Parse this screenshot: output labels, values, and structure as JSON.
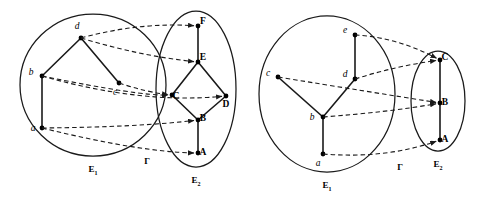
{
  "figure": {
    "background_color": "#ffffff",
    "stroke_color": "#1a1a1a",
    "node_color": "#000000",
    "title": "",
    "panels": [
      {
        "id": "panel-left",
        "source_set": {
          "label": "E",
          "subscript": "1",
          "nodes": [
            {
              "id": "a",
              "label": "a",
              "x": 42,
              "y": 128,
              "label_x": 33,
              "label_y": 131
            },
            {
              "id": "b",
              "label": "b",
              "x": 42,
              "y": 76,
              "label_x": 31,
              "label_y": 75
            },
            {
              "id": "c",
              "label": "c",
              "x": 119,
              "y": 83,
              "label_x": 115,
              "label_y": 95
            },
            {
              "id": "d",
              "label": "d",
              "x": 81,
              "y": 38,
              "label_x": 77,
              "label_y": 29
            }
          ],
          "edges": [
            {
              "from": "a",
              "to": "b"
            },
            {
              "from": "b",
              "to": "d"
            },
            {
              "from": "d",
              "to": "c"
            }
          ],
          "ellipse": {
            "cx": 93,
            "cy": 85,
            "rx": 73,
            "ry": 71
          }
        },
        "target_set": {
          "label": "E",
          "subscript": "2",
          "nodes": [
            {
              "id": "A",
              "label": "A",
              "x": 198,
              "y": 153,
              "label_x": 203,
              "label_y": 155
            },
            {
              "id": "B",
              "label": "B",
              "x": 198,
              "y": 120,
              "label_x": 203,
              "label_y": 121
            },
            {
              "id": "C",
              "label": "C",
              "x": 172,
              "y": 95,
              "label_x": 176,
              "label_y": 99
            },
            {
              "id": "D",
              "label": "D",
              "x": 226,
              "y": 96,
              "label_x": 226,
              "label_y": 107
            },
            {
              "id": "E",
              "label": "E",
              "x": 198,
              "y": 62,
              "label_x": 203,
              "label_y": 60
            },
            {
              "id": "F",
              "label": "F",
              "x": 198,
              "y": 26,
              "label_x": 203,
              "label_y": 24
            }
          ],
          "edges": [
            {
              "from": "A",
              "to": "B"
            },
            {
              "from": "B",
              "to": "C"
            },
            {
              "from": "B",
              "to": "D"
            },
            {
              "from": "C",
              "to": "E"
            },
            {
              "from": "D",
              "to": "E"
            },
            {
              "from": "E",
              "to": "F"
            }
          ],
          "ellipse": {
            "cx": 196,
            "cy": 89,
            "rx": 40,
            "ry": 78
          }
        },
        "map_label": "Γ",
        "map_label_x": 147,
        "map_label_y": 164,
        "mappings": [
          {
            "from": "d",
            "to": "F",
            "cx": 140,
            "cy": 22
          },
          {
            "from": "d",
            "to": "E",
            "cx": 140,
            "cy": 56
          },
          {
            "from": "c",
            "to": "C",
            "cx": 146,
            "cy": 92
          },
          {
            "from": "b",
            "to": "D",
            "cx": 140,
            "cy": 104
          },
          {
            "from": "b",
            "to": "C",
            "cx": 140,
            "cy": 96
          },
          {
            "from": "a",
            "to": "B",
            "cx": 140,
            "cy": 127
          },
          {
            "from": "a",
            "to": "A",
            "cx": 140,
            "cy": 152
          }
        ]
      },
      {
        "id": "panel-right",
        "source_set": {
          "label": "E",
          "subscript": "1",
          "nodes": [
            {
              "id": "a",
              "label": "a",
              "x": 323,
              "y": 154,
              "label_x": 318,
              "label_y": 166
            },
            {
              "id": "b",
              "label": "b",
              "x": 323,
              "y": 117,
              "label_x": 312,
              "label_y": 120
            },
            {
              "id": "c",
              "label": "c",
              "x": 278,
              "y": 77,
              "label_x": 268,
              "label_y": 76
            },
            {
              "id": "d",
              "label": "d",
              "x": 355,
              "y": 79,
              "label_x": 345,
              "label_y": 77
            },
            {
              "id": "e",
              "label": "e",
              "x": 355,
              "y": 35,
              "label_x": 345,
              "label_y": 33
            }
          ],
          "edges": [
            {
              "from": "a",
              "to": "b"
            },
            {
              "from": "b",
              "to": "c"
            },
            {
              "from": "b",
              "to": "d"
            },
            {
              "from": "d",
              "to": "e"
            }
          ],
          "ellipse": {
            "cx": 327,
            "cy": 94,
            "rx": 68,
            "ry": 78
          }
        },
        "target_set": {
          "label": "E",
          "subscript": "2",
          "nodes": [
            {
              "id": "A",
              "label": "A",
              "x": 440,
              "y": 140,
              "label_x": 445,
              "label_y": 142
            },
            {
              "id": "B",
              "label": "B",
              "x": 440,
              "y": 103,
              "label_x": 445,
              "label_y": 105
            },
            {
              "id": "C",
              "label": "C",
              "x": 440,
              "y": 60,
              "label_x": 445,
              "label_y": 60
            }
          ],
          "edges": [
            {
              "from": "A",
              "to": "B"
            },
            {
              "from": "B",
              "to": "C"
            }
          ],
          "ellipse": {
            "cx": 438,
            "cy": 101,
            "rx": 27,
            "ry": 50
          }
        },
        "map_label": "Γ",
        "map_label_x": 400,
        "map_label_y": 170,
        "mappings": [
          {
            "from": "e",
            "to": "C",
            "cx": 396,
            "cy": 37
          },
          {
            "from": "d",
            "to": "C",
            "cx": 396,
            "cy": 66
          },
          {
            "from": "c",
            "to": "B",
            "cx": 370,
            "cy": 92
          },
          {
            "from": "b",
            "to": "B",
            "cx": 390,
            "cy": 112
          },
          {
            "from": "a",
            "to": "A",
            "cx": 385,
            "cy": 159
          }
        ]
      }
    ]
  }
}
